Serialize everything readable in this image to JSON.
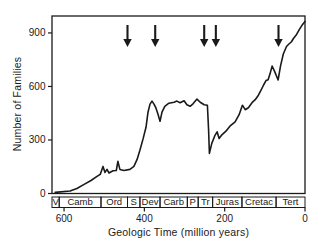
{
  "colors": {
    "line": "#1a1a1a",
    "background": "#ffffff"
  },
  "chart_data": {
    "type": "line",
    "xlabel": "Geologic Time (million years)",
    "ylabel": "Number of Families",
    "x_range": [
      630,
      0
    ],
    "y_range": [
      0,
      995
    ],
    "x_ticks": [
      600,
      400,
      200,
      0
    ],
    "y_ticks": [
      0,
      300,
      600,
      900
    ],
    "grid": false,
    "legend": "none",
    "extinction_arrows_ma": [
      442,
      373,
      251,
      222,
      66
    ],
    "periods": [
      {
        "label": "V",
        "start": 630,
        "end": 612
      },
      {
        "label": "Camb",
        "start": 612,
        "end": 508
      },
      {
        "label": "Ord",
        "start": 508,
        "end": 442
      },
      {
        "label": "S",
        "start": 442,
        "end": 411
      },
      {
        "label": "Dev",
        "start": 411,
        "end": 361
      },
      {
        "label": "Carb",
        "start": 361,
        "end": 293
      },
      {
        "label": "P",
        "start": 293,
        "end": 266
      },
      {
        "label": "Tr",
        "start": 266,
        "end": 230
      },
      {
        "label": "Juras",
        "start": 230,
        "end": 157
      },
      {
        "label": "Cretac",
        "start": 157,
        "end": 72
      },
      {
        "label": "Tert",
        "start": 72,
        "end": 0
      }
    ],
    "series": [
      {
        "name": "Number of Families",
        "points": [
          [
            622,
            6
          ],
          [
            585,
            14
          ],
          [
            568,
            28
          ],
          [
            550,
            51
          ],
          [
            533,
            73
          ],
          [
            518,
            96
          ],
          [
            510,
            107
          ],
          [
            503,
            152
          ],
          [
            498,
            118
          ],
          [
            493,
            135
          ],
          [
            488,
            115
          ],
          [
            478,
            127
          ],
          [
            470,
            129
          ],
          [
            466,
            180
          ],
          [
            461,
            135
          ],
          [
            451,
            129
          ],
          [
            436,
            135
          ],
          [
            426,
            152
          ],
          [
            418,
            191
          ],
          [
            411,
            242
          ],
          [
            403,
            309
          ],
          [
            396,
            371
          ],
          [
            391,
            456
          ],
          [
            386,
            501
          ],
          [
            381,
            518
          ],
          [
            376,
            501
          ],
          [
            371,
            478
          ],
          [
            366,
            444
          ],
          [
            361,
            405
          ],
          [
            356,
            456
          ],
          [
            349,
            489
          ],
          [
            339,
            506
          ],
          [
            326,
            512
          ],
          [
            319,
            518
          ],
          [
            311,
            509
          ],
          [
            301,
            520
          ],
          [
            294,
            498
          ],
          [
            286,
            489
          ],
          [
            279,
            503
          ],
          [
            269,
            529
          ],
          [
            261,
            512
          ],
          [
            251,
            498
          ],
          [
            243,
            495
          ],
          [
            240,
            354
          ],
          [
            238,
            225
          ],
          [
            232,
            281
          ],
          [
            224,
            326
          ],
          [
            219,
            346
          ],
          [
            214,
            309
          ],
          [
            207,
            329
          ],
          [
            197,
            349
          ],
          [
            187,
            377
          ],
          [
            174,
            402
          ],
          [
            164,
            442
          ],
          [
            156,
            495
          ],
          [
            149,
            470
          ],
          [
            141,
            481
          ],
          [
            132,
            509
          ],
          [
            124,
            526
          ],
          [
            116,
            551
          ],
          [
            110,
            577
          ],
          [
            103,
            608
          ],
          [
            97,
            633
          ],
          [
            92,
            638
          ],
          [
            87,
            672
          ],
          [
            82,
            714
          ],
          [
            76,
            686
          ],
          [
            67,
            636
          ],
          [
            61,
            714
          ],
          [
            54,
            782
          ],
          [
            46,
            824
          ],
          [
            40,
            838
          ],
          [
            34,
            849
          ],
          [
            29,
            869
          ],
          [
            21,
            892
          ],
          [
            14,
            920
          ],
          [
            6,
            948
          ],
          [
            0,
            965
          ]
        ]
      }
    ]
  }
}
